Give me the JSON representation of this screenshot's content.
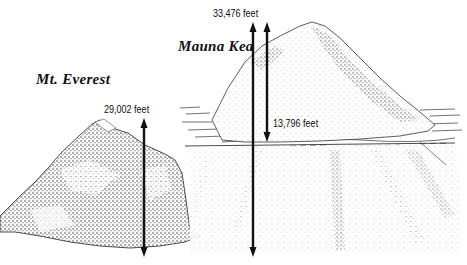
{
  "diagram": {
    "mountains": [
      {
        "name": "Mt. Everest",
        "height_label": "29,002 feet",
        "height_feet": 29002
      },
      {
        "name": "Mauna Kea",
        "total_height_label": "33,476 feet",
        "total_height_feet": 33476,
        "above_sea_label": "13,796 feet",
        "above_sea_feet": 13796
      }
    ],
    "colors": {
      "ink": "#111111",
      "background": "#ffffff"
    }
  }
}
